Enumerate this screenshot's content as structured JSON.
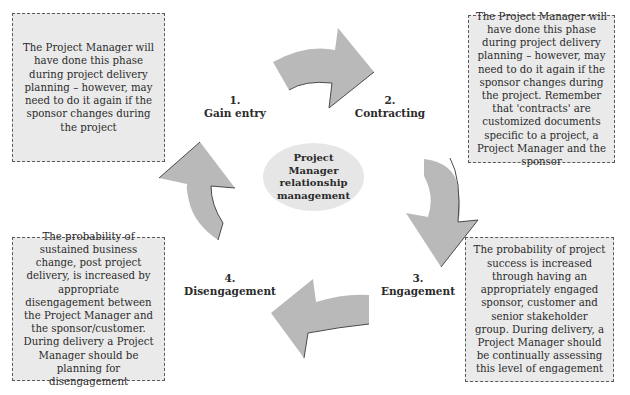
{
  "diagram": {
    "center": {
      "lines": [
        "Project",
        "Manager",
        "relationship",
        "management"
      ]
    },
    "stages": [
      {
        "number": "1.",
        "label": "Gain entry"
      },
      {
        "number": "2.",
        "label": "Contracting"
      },
      {
        "number": "3.",
        "label": "Engagement"
      },
      {
        "number": "4.",
        "label": "Disengagement"
      }
    ],
    "notes": {
      "gain_entry": "The Project Manager will have done this phase during project delivery planning – however, may need to do it again if the sponsor changes during the project",
      "contracting": "The Project Manager will have done this phase during project delivery planning – however, may need to do it again if the sponsor changes during the project. Remember that 'contracts' are customized documents specific to a project, a Project Manager and the sponsor",
      "engagement": "The probability of project success is increased through having an appropriately engaged sponsor, customer and senior stakeholder group. During delivery, a Project Manager should be continually assessing this level of engagement",
      "disengagement": "The probability of sustained business change, post project delivery, is increased by appropriate disengagement between the Project Manager and the sponsor/customer. During delivery a Project Manager should be planning for disengagement"
    },
    "colors": {
      "arrow_fill": "#b9b9b9",
      "arrow_edge": "#4a4a4a",
      "note_fill": "#eaeaea",
      "ellipse_fill": "#e6e6e6"
    }
  }
}
